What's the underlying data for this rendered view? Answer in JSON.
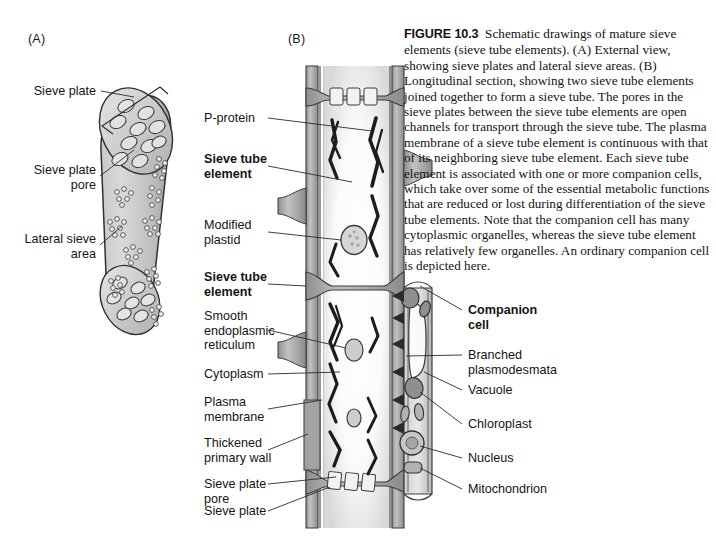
{
  "figure": {
    "number_label": "FIGURE 10.3",
    "caption": "Schematic drawings of mature sieve elements (sieve tube elements). (A) External view, showing sieve plates and lateral sieve areas. (B) Longitudinal section, showing two sieve tube elements joined together to form a sieve tube. The pores in the sieve plates between the sieve tube elements are open channels for transport through the sieve tube. The plasma membrane of a sieve tube element is continuous with that of its neighboring sieve tube element. Each sieve tube element is associated with one or more companion cells, which take over some of the essential metabolic functions that are reduced or lost during differentiation of the sieve tube elements. Note that the companion cell has many cytoplasmic organelles, whereas the sieve tube element has relatively few organelles. An ordinary companion cell is depicted here."
  },
  "panels": {
    "a": {
      "letter": "(A)"
    },
    "b": {
      "letter": "(B)"
    }
  },
  "panel_a_labels": [
    {
      "id": "sieve-plate",
      "text": "Sieve plate",
      "bold": false
    },
    {
      "id": "sieve-plate-pore",
      "text": "Sieve plate\npore",
      "bold": false
    },
    {
      "id": "lateral-sieve-area",
      "text": "Lateral sieve\narea",
      "bold": false
    }
  ],
  "panel_b_left_labels": [
    {
      "id": "p-protein",
      "text": "P-protein",
      "bold": false
    },
    {
      "id": "sieve-tube-element-1",
      "text": "Sieve tube\nelement",
      "bold": true
    },
    {
      "id": "modified-plastid",
      "text": "Modified\nplastid",
      "bold": false
    },
    {
      "id": "sieve-tube-element-2",
      "text": "Sieve tube\nelement",
      "bold": true
    },
    {
      "id": "smooth-er",
      "text": "Smooth\nendoplasmic\nreticulum",
      "bold": false
    },
    {
      "id": "cytoplasm",
      "text": "Cytoplasm",
      "bold": false
    },
    {
      "id": "plasma-membrane",
      "text": "Plasma\nmembrane",
      "bold": false
    },
    {
      "id": "thickened-wall",
      "text": "Thickened\nprimary wall",
      "bold": false
    },
    {
      "id": "sieve-plate-pore-b",
      "text": "Sieve plate\npore",
      "bold": false
    },
    {
      "id": "sieve-plate-b",
      "text": "Sieve plate",
      "bold": false
    }
  ],
  "panel_b_right_labels": [
    {
      "id": "companion-cell",
      "text": "Companion\ncell",
      "bold": true
    },
    {
      "id": "branched-plasmodesmata",
      "text": "Branched\nplasmodesmata",
      "bold": false
    },
    {
      "id": "vacuole",
      "text": "Vacuole",
      "bold": false
    },
    {
      "id": "chloroplast",
      "text": "Chloroplast",
      "bold": false
    },
    {
      "id": "nucleus",
      "text": "Nucleus",
      "bold": false
    },
    {
      "id": "mitochondrion",
      "text": "Mitochondrion",
      "bold": false
    }
  ],
  "colors": {
    "wall_fill": "#b4b4b4",
    "wall_fill_dark": "#9a9a9a",
    "wall_outline": "#3c3c3c",
    "lumen_fill": "#f7f7f7",
    "organelle_fill": "#9c9c9c",
    "organelle_outline": "#3a3a3a",
    "p_protein": "#1c1c1c",
    "leader_line": "#2b2b2b",
    "text": "#141414"
  }
}
